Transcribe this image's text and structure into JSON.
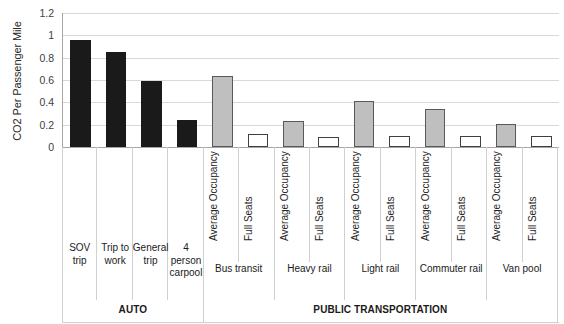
{
  "chart_data": {
    "type": "bar",
    "title": "",
    "xlabel": "",
    "ylabel": "CO2 Per Passenger Mile",
    "ylim": [
      0,
      1.2
    ],
    "ytick_values": [
      0,
      0.2,
      0.4,
      0.6,
      0.8,
      1,
      1.2
    ],
    "ytick_labels": [
      "0",
      "0.2",
      "0.4",
      "0.6",
      "0.8",
      "1",
      "1.2"
    ],
    "grid": true,
    "legend": "none",
    "categories": [
      "SOV trip",
      "Trip to work",
      "General trip",
      "4 person carpool",
      "Bus transit - Average Occupancy",
      "Bus transit - Full Seats",
      "Heavy rail - Average Occupancy",
      "Heavy rail - Full Seats",
      "Light rail - Average Occupancy",
      "Light rail - Full Seats",
      "Commuter rail - Average Occupancy",
      "Commuter rail - Full Seats",
      "Van pool - Average Occupancy",
      "Van pool - Full Seats"
    ],
    "values": [
      0.96,
      0.85,
      0.59,
      0.24,
      0.64,
      0.12,
      0.23,
      0.09,
      0.41,
      0.1,
      0.34,
      0.1,
      0.21,
      0.1
    ],
    "bars": [
      {
        "label": "SOV trip",
        "value": 0.96,
        "style": "solid-black",
        "group": "AUTO",
        "vehicle": "SOV trip",
        "tick_label": ""
      },
      {
        "label": "Trip to work",
        "value": 0.85,
        "style": "solid-black",
        "group": "AUTO",
        "vehicle": "Trip to work",
        "tick_label": ""
      },
      {
        "label": "General trip",
        "value": 0.59,
        "style": "solid-black",
        "group": "AUTO",
        "vehicle": "General trip",
        "tick_label": ""
      },
      {
        "label": "4 person carpool",
        "value": 0.24,
        "style": "solid-black",
        "group": "AUTO",
        "vehicle": "4 person carpool",
        "tick_label": ""
      },
      {
        "label": "Average Occupancy",
        "value": 0.64,
        "style": "gray-filled",
        "group": "PUBLIC TRANSPORTATION",
        "vehicle": "Bus transit",
        "tick_label": "Average Occupancy"
      },
      {
        "label": "Full Seats",
        "value": 0.12,
        "style": "white-outline",
        "group": "PUBLIC TRANSPORTATION",
        "vehicle": "Bus transit",
        "tick_label": "Full Seats"
      },
      {
        "label": "Average Occupancy",
        "value": 0.23,
        "style": "gray-filled",
        "group": "PUBLIC TRANSPORTATION",
        "vehicle": "Heavy rail",
        "tick_label": "Average Occupancy"
      },
      {
        "label": "Full Seats",
        "value": 0.09,
        "style": "white-outline",
        "group": "PUBLIC TRANSPORTATION",
        "vehicle": "Heavy rail",
        "tick_label": "Full Seats"
      },
      {
        "label": "Average Occupancy",
        "value": 0.41,
        "style": "gray-filled",
        "group": "PUBLIC TRANSPORTATION",
        "vehicle": "Light rail",
        "tick_label": "Average Occupancy"
      },
      {
        "label": "Full Seats",
        "value": 0.1,
        "style": "white-outline",
        "group": "PUBLIC TRANSPORTATION",
        "vehicle": "Light rail",
        "tick_label": "Full Seats"
      },
      {
        "label": "Average Occupancy",
        "value": 0.34,
        "style": "gray-filled",
        "group": "PUBLIC TRANSPORTATION",
        "vehicle": "Commuter rail",
        "tick_label": "Average Occupancy"
      },
      {
        "label": "Full Seats",
        "value": 0.1,
        "style": "white-outline",
        "group": "PUBLIC TRANSPORTATION",
        "vehicle": "Commuter rail",
        "tick_label": "Full Seats"
      },
      {
        "label": "Average Occupancy",
        "value": 0.21,
        "style": "gray-filled",
        "group": "PUBLIC TRANSPORTATION",
        "vehicle": "Van pool",
        "tick_label": "Average Occupancy"
      },
      {
        "label": "Full Seats",
        "value": 0.1,
        "style": "white-outline",
        "group": "PUBLIC TRANSPORTATION",
        "vehicle": "Van pool",
        "tick_label": "Full Seats"
      }
    ],
    "vehicle_groups": [
      {
        "label": "SOV trip",
        "span": 1
      },
      {
        "label": "Trip to work",
        "span": 1
      },
      {
        "label": "General trip",
        "span": 1
      },
      {
        "label": "4 person carpool",
        "span": 1
      },
      {
        "label": "Bus transit",
        "span": 2
      },
      {
        "label": "Heavy rail",
        "span": 2
      },
      {
        "label": "Light rail",
        "span": 2
      },
      {
        "label": "Commuter rail",
        "span": 2
      },
      {
        "label": "Van pool",
        "span": 2
      }
    ],
    "super_groups": [
      {
        "label": "AUTO",
        "span": 4
      },
      {
        "label": "PUBLIC TRANSPORTATION",
        "span": 10
      }
    ],
    "colors": {
      "solid-black": "#1a1a1a",
      "gray-filled": "#bfbfbf",
      "gray-outline": "#595959",
      "white-outline": "#ffffff",
      "white-border": "#404040",
      "gridline": "#d9d9d9",
      "axis": "#a6a6a6",
      "text": "#1a1a1a"
    }
  }
}
